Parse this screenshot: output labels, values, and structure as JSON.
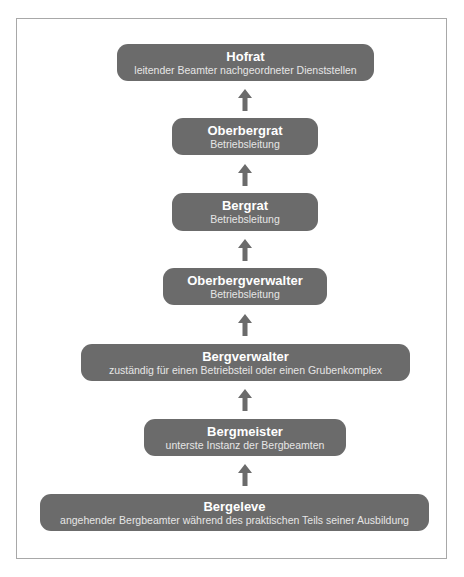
{
  "diagram": {
    "type": "hierarchy",
    "direction": "bottom-to-top",
    "colors": {
      "node_fill": "#6b6b6b",
      "title_text": "#ffffff",
      "subtitle_text": "#e6e6e6",
      "arrow": "#6b6b6b",
      "frame_border": "#a8a8a8"
    },
    "nodes": [
      {
        "title": "Hofrat",
        "subtitle": "leitender Beamter nachgeordneter Dienststellen"
      },
      {
        "title": "Oberbergrat",
        "subtitle": "Betriebsleitung"
      },
      {
        "title": "Bergrat",
        "subtitle": "Betriebsleitung"
      },
      {
        "title": "Oberbergverwalter",
        "subtitle": "Betriebsleitung"
      },
      {
        "title": "Bergverwalter",
        "subtitle": "zuständig für einen Betriebsteil oder einen Grubenkomplex"
      },
      {
        "title": "Bergmeister",
        "subtitle": "unterste Instanz der Bergbeamten"
      },
      {
        "title": "Bergeleve",
        "subtitle": "angehender Bergbeamter während des praktischen Teils seiner Ausbildung"
      }
    ],
    "edges": [
      {
        "from": "Bergeleve",
        "to": "Bergmeister"
      },
      {
        "from": "Bergmeister",
        "to": "Bergverwalter"
      },
      {
        "from": "Bergverwalter",
        "to": "Oberbergverwalter"
      },
      {
        "from": "Oberbergverwalter",
        "to": "Bergrat"
      },
      {
        "from": "Bergrat",
        "to": "Oberbergrat"
      },
      {
        "from": "Oberbergrat",
        "to": "Hofrat"
      }
    ]
  }
}
